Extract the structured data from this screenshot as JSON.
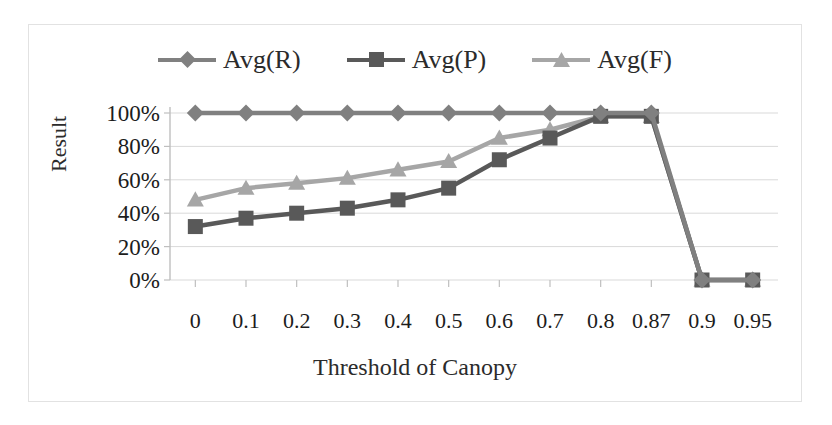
{
  "chart_data": {
    "type": "line",
    "title": "",
    "xlabel": "Threshold of Canopy",
    "ylabel": "Result",
    "categories": [
      "0",
      "0.1",
      "0.2",
      "0.3",
      "0.4",
      "0.5",
      "0.6",
      "0.7",
      "0.8",
      "0.87",
      "0.9",
      "0.95"
    ],
    "ytick_labels": [
      "100%",
      "80%",
      "60%",
      "40%",
      "20%",
      "0%"
    ],
    "ytick_values": [
      100,
      80,
      60,
      40,
      20,
      0
    ],
    "ylim": [
      0,
      100
    ],
    "grid": true,
    "legend_position": "top",
    "series": [
      {
        "name": "Avg(R)",
        "marker": "diamond",
        "color": "#808080",
        "values": [
          100,
          100,
          100,
          100,
          100,
          100,
          100,
          100,
          100,
          100,
          0,
          0
        ]
      },
      {
        "name": "Avg(P)",
        "marker": "square",
        "color": "#595959",
        "values": [
          32,
          37,
          40,
          43,
          48,
          55,
          72,
          85,
          98,
          98,
          0,
          0
        ]
      },
      {
        "name": "Avg(F)",
        "marker": "triangle",
        "color": "#a6a6a6",
        "values": [
          48,
          55,
          58,
          61,
          66,
          71,
          85,
          90,
          98,
          98,
          0,
          0
        ]
      }
    ]
  },
  "colors": {
    "border": "#e2e2e2",
    "gridline": "#d9d9d9",
    "axis": "#bfbfbf",
    "text": "#1c1c1c"
  }
}
